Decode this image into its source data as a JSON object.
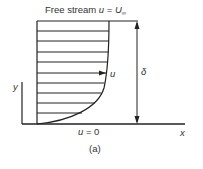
{
  "diagram": {
    "free_stream_label": "Free stream ",
    "free_stream_var": "u",
    "free_stream_eq": " = ",
    "free_stream_value": "U",
    "free_stream_sub": "∞",
    "velocity_label": "u",
    "thickness_label": "δ",
    "wall_label_var": "u",
    "wall_label_eq": " = 0",
    "x_axis_label": "x",
    "y_axis_label": "y",
    "caption": "(a)",
    "profile_lines_y": [
      21,
      31,
      41,
      52,
      62,
      73,
      83,
      93,
      103,
      113
    ],
    "colors": {
      "line": "#222222",
      "text": "#333333",
      "background": "#ffffff"
    }
  }
}
